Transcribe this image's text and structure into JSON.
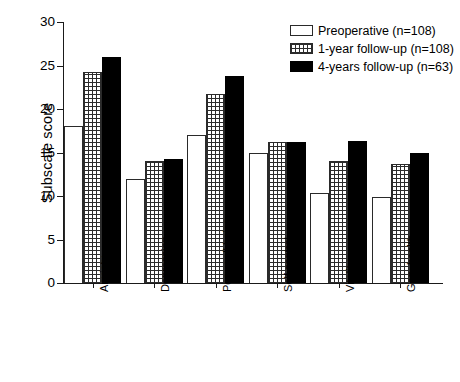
{
  "chart_data": {
    "type": "bar",
    "title": "",
    "xlabel": "",
    "ylabel": "Subscale score",
    "ylim": [
      0,
      30
    ],
    "yticks": [
      0,
      5,
      10,
      15,
      20,
      25,
      30
    ],
    "ytick_labels": [
      "0",
      "5",
      "10",
      "15",
      "20",
      "25",
      "30"
    ],
    "grid": false,
    "legend_position": "top-right",
    "categories": [
      "Anxiety",
      "Depression",
      "Pos. well being",
      "Self control",
      "Vitality",
      "Gen. health"
    ],
    "series": [
      {
        "name": "Preoperative (n=108)",
        "fill": "white",
        "values": [
          18.0,
          11.9,
          17.0,
          15.0,
          10.4,
          9.9
        ]
      },
      {
        "name": "1-year follow-up (n=108)",
        "fill": "cross-hatch",
        "values": [
          24.2,
          14.0,
          21.7,
          16.2,
          14.0,
          13.7
        ]
      },
      {
        "name": "4-years follow-up (n=63)",
        "fill": "black",
        "values": [
          26.0,
          14.3,
          23.8,
          16.2,
          16.3,
          15.0
        ]
      }
    ]
  },
  "legend": {
    "items": [
      {
        "label": "Preoperative (n=108)",
        "swatch": "white-box-icon"
      },
      {
        "label": "1-year follow-up (n=108)",
        "swatch": "hatched-box-icon"
      },
      {
        "label": "4-years follow-up (n=63)",
        "swatch": "black-box-icon"
      }
    ]
  },
  "colors": {
    "axis": "#1a1a1a",
    "bar_outline": "#2a2a2a",
    "bar_black": "#000000",
    "bar_white": "#ffffff",
    "background": "#ffffff"
  }
}
